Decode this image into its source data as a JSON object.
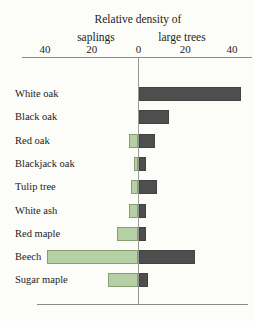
{
  "chart_data": {
    "type": "bar",
    "orientation": "diverging-horizontal",
    "title": "Relative density of",
    "left_label": "saplings",
    "right_label": "large trees",
    "axis_ticks": [
      "40",
      "20",
      "0",
      "20",
      "40"
    ],
    "axis_max": 40,
    "grid": false,
    "legend_position": "top-axis-labels",
    "categories": [
      "White oak",
      "Black oak",
      "Red oak",
      "Blackjack oak",
      "Tulip tree",
      "White ash",
      "Red maple",
      "Beech",
      "Sugar maple"
    ],
    "series": [
      {
        "name": "saplings",
        "direction": "left",
        "color": "#b7cfa5",
        "border_color": "#84a070",
        "values": [
          0,
          0,
          4,
          2,
          3,
          4,
          9,
          39,
          13
        ]
      },
      {
        "name": "large trees",
        "direction": "right",
        "color": "#4e4e4e",
        "border_color": "#424242",
        "values": [
          44,
          13,
          7,
          3,
          8,
          3,
          3,
          24,
          4
        ]
      }
    ],
    "colors": {
      "axis_line": "#8a8a8a",
      "text": "#1c1c1c",
      "background": "#fcfcf9"
    }
  }
}
